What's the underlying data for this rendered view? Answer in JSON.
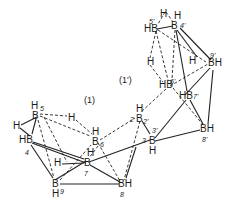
{
  "diagram": {
    "title": "",
    "fragment_labels": [
      {
        "id": "frag-1",
        "text": "(1)",
        "x": 84,
        "y": 96
      },
      {
        "id": "frag-1prime",
        "text": "(1')",
        "x": 119,
        "y": 76
      }
    ],
    "atoms": [
      {
        "id": "H-b45p",
        "text": "H",
        "x": 160,
        "y": 9
      },
      {
        "id": "H-4p",
        "text": "H",
        "x": 174,
        "y": 11
      },
      {
        "id": "B5p",
        "text": "HB",
        "x": 144,
        "y": 24
      },
      {
        "id": "B4p",
        "text": "B",
        "x": 171,
        "y": 21
      },
      {
        "id": "H-b56p",
        "text": "H",
        "x": 147,
        "y": 57
      },
      {
        "id": "H-b49p",
        "text": "H",
        "x": 189,
        "y": 56
      },
      {
        "id": "B9p",
        "text": "BH",
        "x": 208,
        "y": 58
      },
      {
        "id": "B6p",
        "text": "HB",
        "x": 159,
        "y": 80
      },
      {
        "id": "B7p",
        "text": "HB",
        "x": 179,
        "y": 91
      },
      {
        "id": "B8p",
        "text": "BH",
        "x": 200,
        "y": 124
      },
      {
        "id": "H-2p",
        "text": "H",
        "x": 136,
        "y": 104
      },
      {
        "id": "B2p",
        "text": "B",
        "x": 136,
        "y": 114
      },
      {
        "id": "B3p",
        "text": "B",
        "x": 149,
        "y": 136
      },
      {
        "id": "H-3p",
        "text": "H",
        "x": 149,
        "y": 146
      },
      {
        "id": "H-5",
        "text": "H",
        "x": 31,
        "y": 101
      },
      {
        "id": "B5",
        "text": "B",
        "x": 32,
        "y": 111
      },
      {
        "id": "H-b45",
        "text": "H",
        "x": 13,
        "y": 121
      },
      {
        "id": "B4",
        "text": "HB",
        "x": 19,
        "y": 135
      },
      {
        "id": "H-b56",
        "text": "H",
        "x": 68,
        "y": 113
      },
      {
        "id": "H-6",
        "text": "H",
        "x": 92,
        "y": 127
      },
      {
        "id": "B6",
        "text": "B",
        "x": 92,
        "y": 137
      },
      {
        "id": "H-7",
        "text": "H",
        "x": 87,
        "y": 148
      },
      {
        "id": "B7",
        "text": "B",
        "x": 84,
        "y": 158
      },
      {
        "id": "H-b47",
        "text": "H",
        "x": 54,
        "y": 158
      },
      {
        "id": "B9",
        "text": "B",
        "x": 52,
        "y": 179
      },
      {
        "id": "H-9",
        "text": "H",
        "x": 52,
        "y": 189
      },
      {
        "id": "B8",
        "text": "BH",
        "x": 118,
        "y": 179
      }
    ],
    "numbering": [
      {
        "id": "n5p",
        "text": "5'",
        "x": 149,
        "y": 18
      },
      {
        "id": "n4p",
        "text": "4'",
        "x": 180,
        "y": 22
      },
      {
        "id": "n9p",
        "text": "9'",
        "x": 210,
        "y": 52
      },
      {
        "id": "n6p",
        "text": "6'",
        "x": 170,
        "y": 78
      },
      {
        "id": "n7p",
        "text": "7'",
        "x": 193,
        "y": 93
      },
      {
        "id": "n8p",
        "text": "8'",
        "x": 202,
        "y": 136
      },
      {
        "id": "n2",
        "text": "2",
        "x": 130,
        "y": 116
      },
      {
        "id": "n2p",
        "text": "2'",
        "x": 143,
        "y": 118
      },
      {
        "id": "n3p",
        "text": "3'",
        "x": 152,
        "y": 127
      },
      {
        "id": "n3",
        "text": "3",
        "x": 142,
        "y": 137
      },
      {
        "id": "n5",
        "text": "5",
        "x": 40,
        "y": 105
      },
      {
        "id": "n4",
        "text": "4",
        "x": 25,
        "y": 149
      },
      {
        "id": "n6",
        "text": "6",
        "x": 100,
        "y": 141
      },
      {
        "id": "n7",
        "text": "7",
        "x": 84,
        "y": 170
      },
      {
        "id": "n9",
        "text": "9",
        "x": 60,
        "y": 188
      },
      {
        "id": "n8",
        "text": "8",
        "x": 120,
        "y": 191
      }
    ],
    "solid_bonds": [
      [
        157,
        29,
        173,
        26
      ],
      [
        177,
        30,
        197,
        57
      ],
      [
        176,
        30,
        187,
        91
      ],
      [
        180,
        28,
        211,
        60
      ],
      [
        185,
        95,
        210,
        68
      ],
      [
        213,
        70,
        208,
        124
      ],
      [
        190,
        100,
        203,
        124
      ],
      [
        155,
        138,
        186,
        100
      ],
      [
        155,
        141,
        200,
        130
      ],
      [
        142,
        121,
        150,
        134
      ],
      [
        89,
        162,
        150,
        140
      ],
      [
        90,
        165,
        120,
        182
      ],
      [
        136,
        147,
        126,
        178
      ],
      [
        36,
        119,
        32,
        134
      ],
      [
        20,
        128,
        30,
        136
      ],
      [
        37,
        117,
        21,
        125
      ],
      [
        33,
        142,
        84,
        159
      ],
      [
        32,
        143,
        86,
        163
      ],
      [
        31,
        145,
        53,
        178
      ],
      [
        60,
        184,
        119,
        184
      ],
      [
        62,
        164,
        84,
        163
      ],
      [
        86,
        161,
        55,
        180
      ]
    ],
    "dashed_bonds": [
      [
        156,
        31,
        150,
        58
      ],
      [
        156,
        31,
        168,
        80
      ],
      [
        158,
        30,
        206,
        62
      ],
      [
        150,
        65,
        163,
        82
      ],
      [
        175,
        30,
        172,
        80
      ],
      [
        170,
        86,
        208,
        64
      ],
      [
        173,
        88,
        204,
        126
      ],
      [
        166,
        89,
        141,
        112
      ],
      [
        165,
        12,
        158,
        24
      ],
      [
        166,
        12,
        173,
        22
      ],
      [
        40,
        114,
        67,
        116
      ],
      [
        76,
        120,
        92,
        134
      ],
      [
        40,
        116,
        90,
        136
      ],
      [
        38,
        120,
        54,
        178
      ],
      [
        44,
        117,
        67,
        162
      ],
      [
        100,
        140,
        135,
        118
      ],
      [
        98,
        143,
        120,
        181
      ],
      [
        140,
        121,
        124,
        180
      ],
      [
        60,
        180,
        91,
        145
      ],
      [
        98,
        146,
        89,
        158
      ]
    ]
  }
}
